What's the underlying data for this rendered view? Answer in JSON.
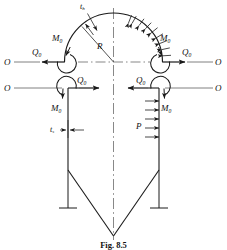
{
  "figure": {
    "caption": "Fig. 8.5",
    "ink_color": "#1a1a1a",
    "line_color": "#333333"
  },
  "labels": {
    "head_thickness": {
      "base": "t",
      "sub": "h"
    },
    "shell_thickness": {
      "base": "t",
      "sub": "s"
    },
    "radius": {
      "base": "R",
      "sub": ""
    },
    "pressure": {
      "base": "P",
      "sub": ""
    },
    "edge_shear": {
      "base": "Q",
      "sub": "0"
    },
    "edge_moment": {
      "base": "M",
      "sub": "0"
    },
    "section_mark": {
      "base": "O",
      "sub": ""
    }
  },
  "annotations": [
    {
      "name": "head-thickness-label",
      "text": "t",
      "sub": "h",
      "x": 80,
      "y": 3,
      "size": "sz8"
    },
    {
      "name": "radius-label",
      "text": "R",
      "sub": "",
      "x": 97,
      "y": 42,
      "size": "sz9"
    },
    {
      "name": "section-o-upper-left",
      "text": "O",
      "sub": "",
      "x": 4,
      "y": 58,
      "size": "sz9"
    },
    {
      "name": "section-o-upper-right",
      "text": "O",
      "sub": "",
      "x": 215,
      "y": 58,
      "size": "sz9"
    },
    {
      "name": "section-o-lower-left",
      "text": "O",
      "sub": "",
      "x": 4,
      "y": 84,
      "size": "sz9"
    },
    {
      "name": "section-o-lower-right",
      "text": "O",
      "sub": "",
      "x": 215,
      "y": 84,
      "size": "sz9"
    },
    {
      "name": "head-left-shear-label",
      "text": "Q",
      "sub": "0",
      "x": 32,
      "y": 48,
      "size": "sz9"
    },
    {
      "name": "head-left-moment-label",
      "text": "M",
      "sub": "0",
      "x": 52,
      "y": 34,
      "size": "sz9"
    },
    {
      "name": "head-right-moment-label",
      "text": "M",
      "sub": "0",
      "x": 160,
      "y": 34,
      "size": "sz9"
    },
    {
      "name": "head-right-shear-label",
      "text": "Q",
      "sub": "0",
      "x": 182,
      "y": 48,
      "size": "sz9"
    },
    {
      "name": "shell-left-shear-label",
      "text": "Q",
      "sub": "0",
      "x": 77,
      "y": 76,
      "size": "sz9"
    },
    {
      "name": "shell-left-moment-label",
      "text": "M",
      "sub": "0",
      "x": 51,
      "y": 104,
      "size": "sz9"
    },
    {
      "name": "shell-right-shear-label",
      "text": "Q",
      "sub": "0",
      "x": 136,
      "y": 76,
      "size": "sz9"
    },
    {
      "name": "shell-right-moment-label",
      "text": "M",
      "sub": "0",
      "x": 161,
      "y": 104,
      "size": "sz9"
    },
    {
      "name": "shell-thickness-label",
      "text": "t",
      "sub": "s",
      "x": 50,
      "y": 126,
      "size": "sz8"
    },
    {
      "name": "pressure-label",
      "text": "P",
      "sub": "",
      "x": 136,
      "y": 122,
      "size": "sz9"
    }
  ],
  "geometry": {
    "center_x": 113.5,
    "head_center_y": 62,
    "head_radius": 49,
    "shell_left_x": 68,
    "shell_right_x": 159,
    "shell_top_y": 88,
    "shell_bottom_y": 170,
    "cone_apex_y": 236,
    "upper_section_line_y": 62,
    "lower_section_line_y": 88,
    "pressure_arrow_count_head": 9,
    "pressure_arrow_count_shell": 5
  }
}
